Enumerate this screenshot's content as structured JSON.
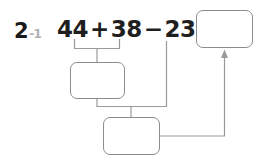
{
  "problem": {
    "number_major": "2",
    "number_minor": "-1"
  },
  "equation": {
    "operand_one": "44",
    "operator_one": "+",
    "operand_two": "38",
    "operator_two": "−",
    "operand_three": "23",
    "equals": "="
  },
  "answer_boxes": {
    "step_one": {
      "value": "",
      "placeholder": ""
    },
    "step_two": {
      "value": "",
      "placeholder": ""
    },
    "result": {
      "value": "",
      "placeholder": ""
    }
  },
  "connectors": {
    "bracket_addition_label": "bracket-under-44-plus-38",
    "bracket_subtraction_label": "bracket-to-minus-23",
    "arrow_label": "arrow-to-result"
  },
  "colors": {
    "text": "#1f1f1f",
    "label_minor": "#b0b0b0",
    "box_border": "#8c8c8c",
    "connector": "#9a9a9a",
    "background": "#ffffff"
  }
}
